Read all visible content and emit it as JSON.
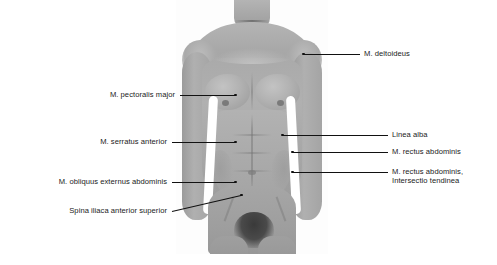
{
  "figure": {
    "background_color": "#ffffff",
    "leader_color": "#111111",
    "text_color": "#1a1a1a"
  },
  "labels": {
    "left": [
      {
        "text": "M. pectoralis major",
        "y": 95,
        "text_right": 175,
        "line_end_x": 236
      },
      {
        "text": "M. serratus anterior",
        "y": 142,
        "text_right": 167,
        "line_end_x": 236
      },
      {
        "text": "M. obliquus externus abdominis",
        "y": 182,
        "text_right": 167,
        "line_end_x": 236
      },
      {
        "text": "Spina iliaca anterior superior",
        "y": 211,
        "text_right": 167,
        "line_end_x": 240
      }
    ],
    "right": [
      {
        "text": "M. deltoideus",
        "y": 54,
        "text_left": 364,
        "line_start_x": 332
      },
      {
        "text": "Linea alba",
        "y": 135,
        "text_left": 392,
        "line_start_x": 282
      },
      {
        "text": "M. rectus abdominis",
        "y": 152,
        "text_left": 392,
        "line_start_x": 292
      }
    ],
    "right_multiline": [
      {
        "line1": "M. rectus abdominis,",
        "line2": "Intersectio tendinea",
        "y": 172,
        "text_left": 392,
        "line_start_x": 292
      }
    ]
  }
}
